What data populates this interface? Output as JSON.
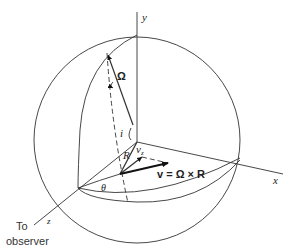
{
  "diagram": {
    "type": "rotating-sphere-geometry",
    "axes": {
      "y_label": "y",
      "x_label": "x",
      "z_label": "z"
    },
    "labels": {
      "omega": "Ω",
      "inclination": "i",
      "radius": "R",
      "vz": "v",
      "vz_sub": "z",
      "theta": "θ",
      "velocity_eq_v": "v",
      "velocity_eq_rest": "= Ω × R",
      "observer_line1": "To",
      "observer_line2": "observer"
    },
    "colors": {
      "line": "#333333",
      "background": "#ffffff"
    }
  }
}
